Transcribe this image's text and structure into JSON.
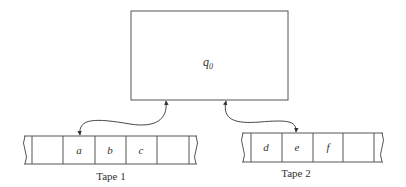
{
  "diagram": {
    "control_unit": {
      "state_label": "q",
      "state_subscript": "0"
    },
    "tapes": [
      {
        "label": "Tape 1",
        "cells": [
          "",
          "a",
          "b",
          "c",
          ""
        ],
        "head_cell_index": 1
      },
      {
        "label": "Tape 2",
        "cells": [
          "d",
          "e",
          "f",
          ""
        ],
        "head_cell_index": 1
      }
    ]
  },
  "colors": {
    "stroke": "#555555",
    "text": "#333333",
    "background": "#ffffff"
  }
}
